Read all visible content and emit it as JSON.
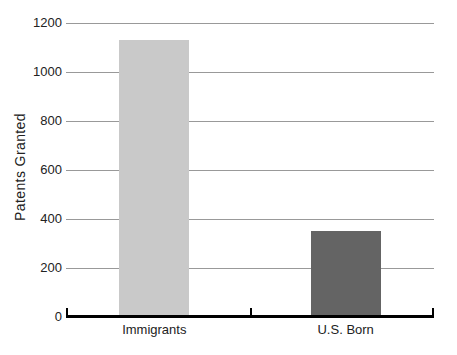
{
  "chart_data": {
    "type": "bar",
    "title": "",
    "categories": [
      "Immigrants",
      "U.S. Born"
    ],
    "values": [
      1130,
      350
    ],
    "bar_colors": [
      "#c9c9c9",
      "#646464"
    ],
    "xlabel": "",
    "ylabel": "Patents Granted",
    "ylim": [
      0,
      1200
    ],
    "yticks": [
      0,
      200,
      400,
      600,
      800,
      1000,
      1200
    ],
    "ytick_labels": [
      "0",
      "200",
      "400",
      "600",
      "800",
      "1000",
      "1200"
    ],
    "grid": true,
    "gridline_color": "#999999",
    "axis_color": "#000000",
    "text_color": "#222222",
    "background": "#ffffff",
    "legend": "none"
  }
}
